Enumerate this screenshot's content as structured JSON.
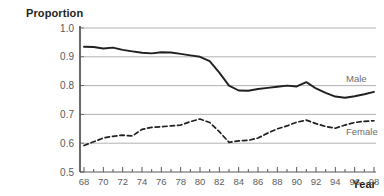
{
  "chart_data": {
    "type": "line",
    "title": "",
    "xlabel": "Year",
    "ylabel": "Proportion",
    "xlim": [
      68,
      98
    ],
    "ylim": [
      0.5,
      1.0
    ],
    "grid": true,
    "legend_position": "right-inline",
    "x": [
      68,
      69,
      70,
      71,
      72,
      73,
      74,
      75,
      76,
      77,
      78,
      79,
      80,
      81,
      82,
      83,
      84,
      85,
      86,
      87,
      88,
      89,
      90,
      91,
      92,
      93,
      94,
      95,
      96,
      97,
      98
    ],
    "xticks": [
      "68",
      "70",
      "72",
      "74",
      "76",
      "78",
      "80",
      "82",
      "84",
      "86",
      "88",
      "90",
      "92",
      "94",
      "96",
      "98"
    ],
    "yticks": [
      "0.5",
      "0.6",
      "0.7",
      "0.8",
      "0.9",
      "1.0"
    ],
    "series": [
      {
        "name": "Male",
        "style": "solid",
        "color": "#231f20",
        "values": [
          0.935,
          0.934,
          0.929,
          0.932,
          0.924,
          0.919,
          0.914,
          0.912,
          0.916,
          0.915,
          0.91,
          0.905,
          0.9,
          0.885,
          0.845,
          0.8,
          0.783,
          0.782,
          0.788,
          0.792,
          0.796,
          0.8,
          0.797,
          0.812,
          0.79,
          0.775,
          0.762,
          0.758,
          0.763,
          0.77,
          0.778
        ]
      },
      {
        "name": "Female",
        "style": "dashed",
        "color": "#231f20",
        "values": [
          0.592,
          0.605,
          0.618,
          0.624,
          0.628,
          0.625,
          0.648,
          0.655,
          0.657,
          0.66,
          0.663,
          0.675,
          0.684,
          0.672,
          0.64,
          0.603,
          0.608,
          0.61,
          0.618,
          0.635,
          0.65,
          0.66,
          0.673,
          0.68,
          0.668,
          0.658,
          0.652,
          0.663,
          0.672,
          0.676,
          0.678
        ]
      }
    ]
  }
}
